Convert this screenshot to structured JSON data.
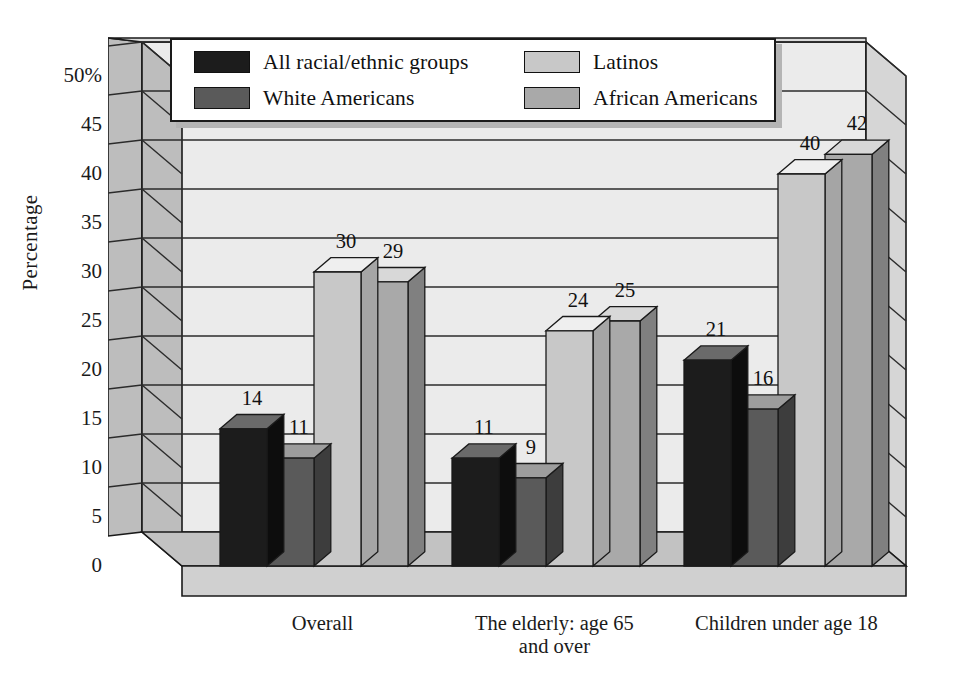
{
  "chart_data": {
    "type": "bar",
    "title": "",
    "subtitle": "",
    "xlabel": "",
    "ylabel": "Percentage",
    "ylim": [
      0,
      50
    ],
    "ytick_step": 5,
    "ytick_labels": [
      "50%",
      "45",
      "40",
      "35",
      "30",
      "25",
      "20",
      "15",
      "10",
      "5",
      "0"
    ],
    "ytick_values": [
      50,
      45,
      40,
      35,
      30,
      25,
      20,
      15,
      10,
      5,
      0
    ],
    "grid": true,
    "grid_axis": "y",
    "legend_position": "top-center",
    "three_d": true,
    "categories": [
      "Overall",
      "The elderly: age 65 and over",
      "Children under age 18"
    ],
    "category_lines": [
      [
        "Overall"
      ],
      [
        "The elderly: age 65",
        "and over"
      ],
      [
        "Children under age 18"
      ]
    ],
    "series": [
      {
        "name": "All racial/ethnic groups",
        "color": "#1c1c1c",
        "side_color": "#0d0d0d",
        "top_color": "#6a6a6a",
        "values": [
          14,
          11,
          21
        ]
      },
      {
        "name": "White Americans",
        "color": "#5a5a5a",
        "side_color": "#3d3d3d",
        "top_color": "#9d9d9d",
        "values": [
          11,
          9,
          16
        ]
      },
      {
        "name": "Latinos",
        "color": "#c8c8c8",
        "side_color": "#a5a5a5",
        "top_color": "#efefef",
        "values": [
          30,
          24,
          40
        ]
      },
      {
        "name": "African Americans",
        "color": "#a9a9a9",
        "side_color": "#808080",
        "top_color": "#d8d8d8",
        "values": [
          29,
          25,
          42
        ]
      }
    ]
  },
  "legend": {
    "entries": [
      {
        "label": "All racial/ethnic groups",
        "swatch": "#1c1c1c"
      },
      {
        "label": "Latinos",
        "swatch": "#c8c8c8"
      },
      {
        "label": "White Americans",
        "swatch": "#5a5a5a"
      },
      {
        "label": "African Americans",
        "swatch": "#a9a9a9"
      }
    ]
  },
  "colors": {
    "back_wall": "#ebebeb",
    "left_wall": "#bdbdbd",
    "right_wall": "#d6d6d6",
    "floor": "#c2c2c2",
    "floor_front": "#d0d0d0",
    "outline": "#1a1a1a",
    "gridline": "#2b2b2b",
    "background": "#ffffff"
  }
}
